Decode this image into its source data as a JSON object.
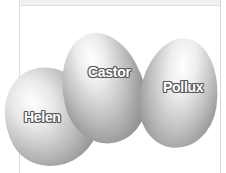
{
  "illustration": {
    "subject": "three eggs",
    "eggs": [
      {
        "label": "Helen"
      },
      {
        "label": "Castor"
      },
      {
        "label": "Pollux"
      }
    ],
    "colors": {
      "background": "#ffffff",
      "egg_highlight": "#ffffff",
      "egg_shadow": "#8f8f8f",
      "label_text": "#ffffff",
      "label_outline": "#5a5a5a"
    }
  }
}
